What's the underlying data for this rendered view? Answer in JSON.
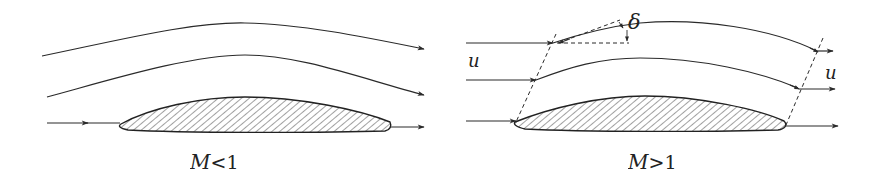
{
  "figure": {
    "panels": [
      {
        "id": "subsonic",
        "caption_symbol": "M",
        "caption_relation": "<1",
        "caption": "M<1"
      },
      {
        "id": "supersonic",
        "caption_symbol": "M",
        "caption_relation": ">1",
        "caption": "M>1",
        "labels": {
          "deflection_angle": "δ",
          "upstream_velocity": "u",
          "downstream_velocity": "u"
        }
      }
    ],
    "colors": {
      "line": "#2a2a2a",
      "hatch": "#444444",
      "background": "#ffffff"
    }
  }
}
